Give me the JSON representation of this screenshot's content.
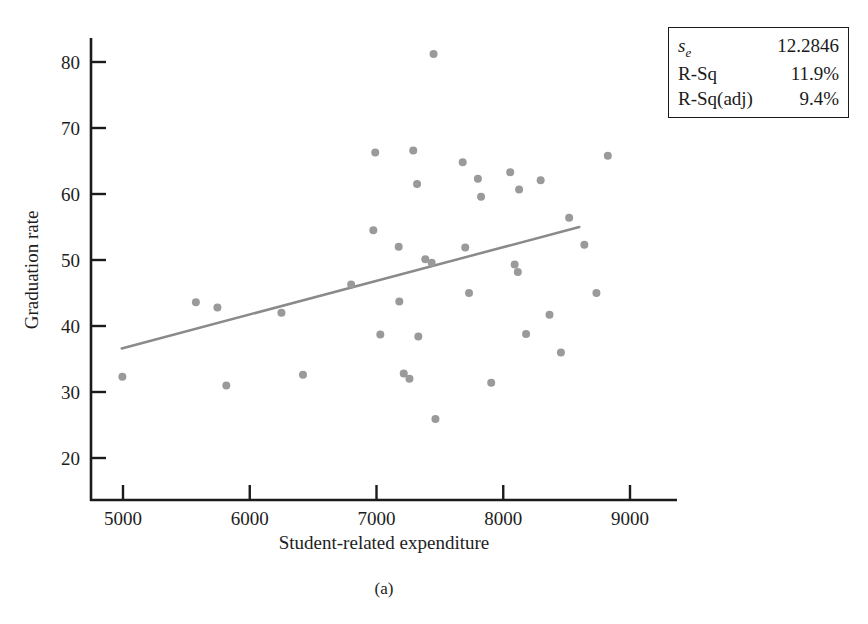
{
  "figure": {
    "caption": "(a)",
    "background_color": "#ffffff",
    "axis_color": "#1b1b1b",
    "marker_color": "#9a9a9a",
    "fit_line_color": "#8a8a8a"
  },
  "stats_box": {
    "border_color": "#1b1b1b",
    "rows": [
      {
        "label_main": "s",
        "label_sub": "e",
        "label_tail": "",
        "value": "12.2846"
      },
      {
        "label_main": "R-Sq",
        "label_sub": "",
        "label_tail": "",
        "value": "11.9%"
      },
      {
        "label_main": "R-Sq(adj)",
        "label_sub": "",
        "label_tail": "",
        "value": "9.4%"
      }
    ]
  },
  "chart_data": {
    "type": "scatter",
    "title": "",
    "xlabel": "Student-related expenditure",
    "ylabel": "Graduation rate",
    "xlim": [
      4640,
      9300
    ],
    "ylim": [
      16.5,
      84
    ],
    "xticks": [
      5000,
      6000,
      7000,
      8000,
      9000
    ],
    "xticklabels": [
      "5000",
      "6000",
      "7000",
      "8000",
      "9000"
    ],
    "yticks": [
      20,
      30,
      40,
      50,
      60,
      70,
      80
    ],
    "yticklabels": [
      "20",
      "30",
      "40",
      "50",
      "60",
      "70",
      "80"
    ],
    "grid": false,
    "legend": null,
    "points": [
      {
        "x": 4995,
        "y": 32.3
      },
      {
        "x": 5575,
        "y": 43.6
      },
      {
        "x": 5745,
        "y": 42.8
      },
      {
        "x": 5815,
        "y": 31.0
      },
      {
        "x": 6250,
        "y": 42.0
      },
      {
        "x": 6420,
        "y": 32.6
      },
      {
        "x": 6800,
        "y": 46.3
      },
      {
        "x": 6975,
        "y": 54.5
      },
      {
        "x": 6990,
        "y": 66.3
      },
      {
        "x": 7030,
        "y": 38.7
      },
      {
        "x": 7175,
        "y": 52.0
      },
      {
        "x": 7180,
        "y": 43.7
      },
      {
        "x": 7215,
        "y": 32.8
      },
      {
        "x": 7260,
        "y": 32.0
      },
      {
        "x": 7290,
        "y": 66.6
      },
      {
        "x": 7320,
        "y": 61.5
      },
      {
        "x": 7330,
        "y": 38.4
      },
      {
        "x": 7385,
        "y": 50.1
      },
      {
        "x": 7435,
        "y": 49.6
      },
      {
        "x": 7450,
        "y": 81.2
      },
      {
        "x": 7465,
        "y": 25.9
      },
      {
        "x": 7680,
        "y": 64.8
      },
      {
        "x": 7700,
        "y": 51.9
      },
      {
        "x": 7730,
        "y": 45.0
      },
      {
        "x": 7800,
        "y": 62.3
      },
      {
        "x": 7825,
        "y": 59.6
      },
      {
        "x": 7905,
        "y": 31.4
      },
      {
        "x": 8055,
        "y": 63.3
      },
      {
        "x": 8090,
        "y": 49.3
      },
      {
        "x": 8115,
        "y": 48.2
      },
      {
        "x": 8125,
        "y": 60.7
      },
      {
        "x": 8180,
        "y": 38.8
      },
      {
        "x": 8295,
        "y": 62.1
      },
      {
        "x": 8365,
        "y": 41.7
      },
      {
        "x": 8455,
        "y": 36.0
      },
      {
        "x": 8520,
        "y": 56.4
      },
      {
        "x": 8640,
        "y": 52.3
      },
      {
        "x": 8735,
        "y": 45.0
      },
      {
        "x": 8825,
        "y": 65.8
      }
    ],
    "fit_line": {
      "x1": 4990,
      "y1": 36.6,
      "x2": 8600,
      "y2": 55.0,
      "se": "12.2846",
      "r_sq": "11.9%",
      "r_sq_adj": "9.4%"
    }
  }
}
